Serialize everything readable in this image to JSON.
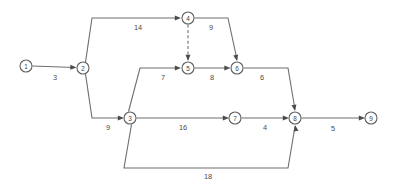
{
  "diagram": {
    "type": "directed-network",
    "colors": {
      "background": "#ffffff",
      "edge": "#6e6e6e",
      "node_stroke": "#5f5f5f",
      "node_fill": "#ffffff",
      "label_text": "#4a4a4a",
      "arrowhead": "#4c4c4c"
    },
    "nodes": [
      {
        "id": "1",
        "label": "1",
        "x": 26,
        "y": 66,
        "r": 6
      },
      {
        "id": "2",
        "label": "2",
        "x": 83,
        "y": 68,
        "r": 6
      },
      {
        "id": "3",
        "label": "3",
        "x": 130,
        "y": 118,
        "r": 6
      },
      {
        "id": "4",
        "label": "4",
        "x": 188,
        "y": 18,
        "r": 6
      },
      {
        "id": "5",
        "label": "5",
        "x": 188,
        "y": 68,
        "r": 6
      },
      {
        "id": "6",
        "label": "6",
        "x": 237,
        "y": 68,
        "r": 6
      },
      {
        "id": "7",
        "label": "7",
        "x": 235,
        "y": 118,
        "r": 6
      },
      {
        "id": "8",
        "label": "8",
        "x": 295,
        "y": 118,
        "r": 6
      },
      {
        "id": "9",
        "label": "9",
        "x": 371,
        "y": 118,
        "r": 6
      }
    ],
    "edges": [
      {
        "id": "e1-2",
        "from": "1",
        "to": "2",
        "weight": "3",
        "style": "solid",
        "label_x": 55,
        "label_y": 77,
        "path": "M 32.5 66 L 74.5 67.5"
      },
      {
        "id": "e2-4",
        "from": "2",
        "to": "4",
        "weight": "14",
        "style": "solid",
        "label_x": 138,
        "label_y": 27,
        "path": "M 85.5 62.2 L 92 18 L 178.5 18"
      },
      {
        "id": "e2-3",
        "from": "2",
        "to": "3",
        "weight": "9",
        "style": "solid",
        "label_x": 108,
        "label_y": 127,
        "path": "M 85.5 73.8 L 92 118 L 121.5 118"
      },
      {
        "id": "e4-6",
        "from": "4",
        "to": "6",
        "weight": "9",
        "style": "solid",
        "label_x": 211,
        "label_y": 27,
        "path": "M 194.5 18 L 228 18 L 237 59.5"
      },
      {
        "id": "e4-5",
        "from": "4",
        "to": "5",
        "weight": "",
        "style": "dashed",
        "label_x": 0,
        "label_y": 0,
        "path": "M 188 24.5 L 188 59.5"
      },
      {
        "id": "e3-5",
        "from": "3",
        "to": "5",
        "weight": "7",
        "style": "solid",
        "label_x": 163,
        "label_y": 77,
        "path": "M 128.5 111.5 L 140 68 L 178.5 68"
      },
      {
        "id": "e5-6",
        "from": "5",
        "to": "6",
        "weight": "8",
        "style": "solid",
        "label_x": 212,
        "label_y": 77,
        "path": "M 194.5 68 L 228 68"
      },
      {
        "id": "e6-8",
        "from": "6",
        "to": "8",
        "weight": "6",
        "style": "solid",
        "label_x": 262,
        "label_y": 77,
        "path": "M 243.5 68 L 288 68 L 295 109.5"
      },
      {
        "id": "e3-7",
        "from": "3",
        "to": "7",
        "weight": "16",
        "style": "solid",
        "label_x": 183,
        "label_y": 127,
        "path": "M 136.5 118 L 226.5 118"
      },
      {
        "id": "e7-8",
        "from": "7",
        "to": "8",
        "weight": "4",
        "style": "solid",
        "label_x": 265,
        "label_y": 127,
        "path": "M 241.5 118 L 286.5 118"
      },
      {
        "id": "e3-8",
        "from": "3",
        "to": "8",
        "weight": "18",
        "style": "solid",
        "label_x": 208,
        "label_y": 176,
        "path": "M 131.5 124.5 L 124 168 L 288 168 L 295 126.5"
      },
      {
        "id": "e8-9",
        "from": "8",
        "to": "9",
        "weight": "5",
        "style": "solid",
        "label_x": 333,
        "label_y": 128,
        "path": "M 301.5 118 L 362.5 118"
      }
    ],
    "arrowheads": [
      {
        "id": "ah-2",
        "for_edge": "e1-2",
        "x": 76.5,
        "y": 67.5,
        "angle": 2
      },
      {
        "id": "ah-4",
        "for_edge": "e2-4",
        "x": 181,
        "y": 18,
        "angle": 0
      },
      {
        "id": "ah-3",
        "for_edge": "e2-3",
        "x": 124,
        "y": 118,
        "angle": 0
      },
      {
        "id": "ah-5d",
        "for_edge": "e4-5",
        "x": 188,
        "y": 61,
        "angle": 90
      },
      {
        "id": "ah-5",
        "for_edge": "e3-5",
        "x": 181,
        "y": 68,
        "angle": 0
      },
      {
        "id": "ah-6a",
        "for_edge": "e5-6",
        "x": 230.5,
        "y": 68,
        "angle": 0
      },
      {
        "id": "ah-6b",
        "for_edge": "e4-6",
        "x": 237,
        "y": 61,
        "angle": 78
      },
      {
        "id": "ah-7",
        "for_edge": "e3-7",
        "x": 229,
        "y": 118,
        "angle": 0
      },
      {
        "id": "ah-8a",
        "for_edge": "e7-8",
        "x": 289,
        "y": 118,
        "angle": 0
      },
      {
        "id": "ah-8b",
        "for_edge": "e6-8",
        "x": 295,
        "y": 111,
        "angle": 80
      },
      {
        "id": "ah-8c",
        "for_edge": "e3-8",
        "x": 295,
        "y": 125,
        "angle": 260
      },
      {
        "id": "ah-9",
        "for_edge": "e8-9",
        "x": 365,
        "y": 118,
        "angle": 0
      }
    ]
  }
}
